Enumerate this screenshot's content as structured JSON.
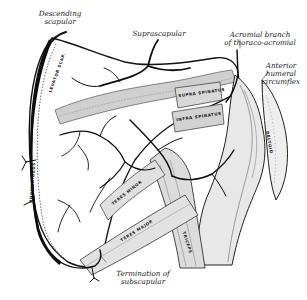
{
  "figure": {
    "type": "anatomical-illustration",
    "background": "#ffffff",
    "ink_color": "#111111",
    "vessel_color": "#0d0d0d",
    "muscle_shade": "#9a9a9a"
  },
  "labels": {
    "descending_scapular": {
      "line1": "Descending",
      "line2": "scapular"
    },
    "suprascapular": {
      "line1": "Suprascapular"
    },
    "acromial_branch": {
      "line1": "Acromial branch",
      "line2": "of thoraco-acromial"
    },
    "anterior_humeral_circumflex": {
      "line1": "Anterior",
      "line2": "humeral",
      "line3": "circumflex"
    },
    "termination_subscapular": {
      "line1": "Termination of",
      "line2": "subscapular"
    }
  },
  "muscle_labels": {
    "supraspinatus": "SUPRA SPINATUS",
    "infraspinatus": "INFRA SPINATUS",
    "teres_minor": "TERES MINOR",
    "teres_major": "TERES MAJOR",
    "triceps": "TRICEPS",
    "deltoid": "DELTOID",
    "levator": "LEVATOR SCAP.",
    "rhomboid": "RHOMBOIDEUS"
  }
}
